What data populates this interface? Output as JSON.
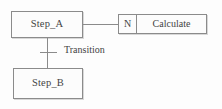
{
  "diagram": {
    "type": "sfc-step-transition-diagram",
    "steps": [
      {
        "id": "step-a",
        "label": "Step_A"
      },
      {
        "id": "step-b",
        "label": "Step_B"
      }
    ],
    "action_block": {
      "qualifier": "N",
      "action_name": "Calculate"
    },
    "transition": {
      "label": "Transition"
    },
    "colors": {
      "line": "#8b8b8b",
      "text": "#444444",
      "background": "#fdfdfd",
      "box_fill": "#fcfcfc"
    }
  }
}
